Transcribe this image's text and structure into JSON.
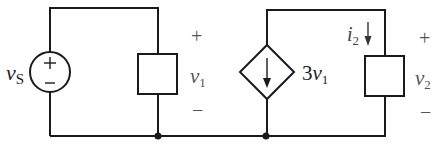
{
  "diagram": {
    "type": "circuit",
    "stroke_color": "#1a1a1a",
    "source": {
      "label_main": "v",
      "label_sub": "S",
      "plus": "+",
      "minus": "−"
    },
    "element1": {
      "plus": "+",
      "label_main": "v",
      "label_sub": "1",
      "minus": "−"
    },
    "dependent_source": {
      "gain": "3",
      "label_main": "v",
      "label_sub": "1"
    },
    "element2": {
      "current_main": "i",
      "current_sub": "2",
      "plus": "+",
      "label_main": "v",
      "label_sub": "2",
      "minus": "−"
    }
  }
}
